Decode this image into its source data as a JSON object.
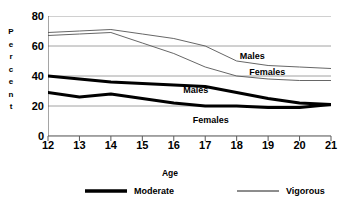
{
  "chart_data": {
    "type": "line",
    "title": "",
    "xlabel": "Age",
    "ylabel": "Percent",
    "categories": [
      12,
      13,
      14,
      15,
      16,
      17,
      18,
      19,
      20,
      21
    ],
    "x": [
      12,
      13,
      14,
      15,
      16,
      17,
      18,
      19,
      20,
      21
    ],
    "xlim": [
      12,
      21
    ],
    "ylim": [
      0,
      80
    ],
    "yticks": [
      0,
      20,
      40,
      60,
      80
    ],
    "xticks": [
      "12",
      "13",
      "14",
      "15",
      "16",
      "17",
      "18",
      "19",
      "20",
      "21"
    ],
    "grid": true,
    "legend_position": "bottom",
    "series": [
      {
        "name": "Vigorous Males",
        "style": "thin",
        "color": "#555555",
        "inline_label": "Males",
        "values": [
          69,
          70,
          71,
          68,
          65,
          60,
          50,
          47,
          46,
          45
        ]
      },
      {
        "name": "Vigorous Females",
        "style": "thin",
        "color": "#555555",
        "inline_label": "Females",
        "values": [
          67,
          68,
          69,
          62,
          55,
          46,
          40,
          38,
          37,
          37
        ]
      },
      {
        "name": "Moderate Males",
        "style": "thick",
        "color": "#000000",
        "inline_label": "Males",
        "values": [
          40,
          38,
          36,
          35,
          34,
          33,
          29,
          25,
          22,
          21
        ]
      },
      {
        "name": "Moderate Females",
        "style": "thick",
        "color": "#000000",
        "inline_label": "Females",
        "values": [
          29,
          26,
          28,
          25,
          22,
          20,
          20,
          19,
          19,
          21
        ]
      }
    ],
    "legend": [
      {
        "label": "Moderate",
        "style": "thick"
      },
      {
        "label": "Vigorous",
        "style": "thin"
      }
    ],
    "annotations": [
      {
        "text": "Males",
        "x": 18.1,
        "y": 53
      },
      {
        "text": "Females",
        "x": 18.4,
        "y": 42
      },
      {
        "text": "Males",
        "x": 16.3,
        "y": 30
      },
      {
        "text": "Females",
        "x": 16.6,
        "y": 10
      }
    ]
  }
}
